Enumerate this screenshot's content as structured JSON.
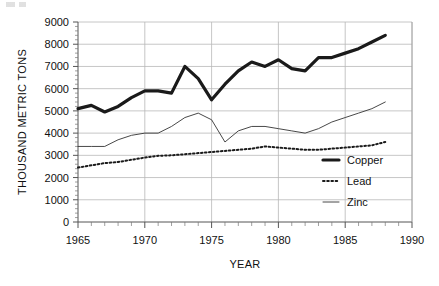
{
  "chart_data": {
    "type": "line",
    "title": "",
    "xlabel": "YEAR",
    "ylabel": "THOUSAND METRIC TONS",
    "xlim": [
      1965,
      1990
    ],
    "ylim": [
      0,
      9000
    ],
    "xticks": [
      1965,
      1970,
      1975,
      1980,
      1985,
      1990
    ],
    "xtick_labels": [
      "1965",
      "1970",
      "1975",
      "1980",
      "1985",
      "1990"
    ],
    "yticks": [
      0,
      1000,
      2000,
      3000,
      4000,
      5000,
      6000,
      7000,
      8000,
      9000
    ],
    "ytick_labels": [
      "0",
      "1000",
      "2000",
      "3000",
      "4000",
      "5000",
      "6000",
      "7000",
      "8000",
      "9000"
    ],
    "grid": "horizontal-and-vertical",
    "minor_ticks": true,
    "legend_position": "right-inside-lower",
    "x": [
      1965,
      1966,
      1967,
      1968,
      1969,
      1970,
      1971,
      1972,
      1973,
      1974,
      1975,
      1976,
      1977,
      1978,
      1979,
      1980,
      1981,
      1982,
      1983,
      1984,
      1985,
      1986,
      1987,
      1988
    ],
    "series": [
      {
        "name": "Copper",
        "style": "thick-solid",
        "color": "#1a1a1a",
        "values": [
          5100,
          5250,
          4950,
          5200,
          5600,
          5900,
          5900,
          5800,
          7000,
          6450,
          5500,
          6200,
          6800,
          7200,
          7000,
          7300,
          6900,
          6800,
          7400,
          7400,
          7600,
          7800,
          8100,
          8400
        ]
      },
      {
        "name": "Lead",
        "style": "dotted",
        "color": "#1a1a1a",
        "values": [
          2450,
          2550,
          2650,
          2700,
          2800,
          2900,
          2980,
          3000,
          3050,
          3100,
          3150,
          3200,
          3250,
          3300,
          3400,
          3350,
          3300,
          3250,
          3250,
          3300,
          3350,
          3400,
          3450,
          3600
        ]
      },
      {
        "name": "Zinc",
        "style": "thin-solid",
        "color": "#333333",
        "values": [
          3400,
          3400,
          3400,
          3700,
          3900,
          4000,
          4000,
          4300,
          4700,
          4900,
          4600,
          3600,
          4100,
          4300,
          4300,
          4200,
          4100,
          4000,
          4200,
          4500,
          4700,
          4900,
          5100,
          5400
        ]
      }
    ],
    "legend": [
      {
        "label": "Copper",
        "style": "thick-solid"
      },
      {
        "label": "Lead",
        "style": "dotted"
      },
      {
        "label": "Zinc",
        "style": "thin-solid"
      }
    ]
  }
}
